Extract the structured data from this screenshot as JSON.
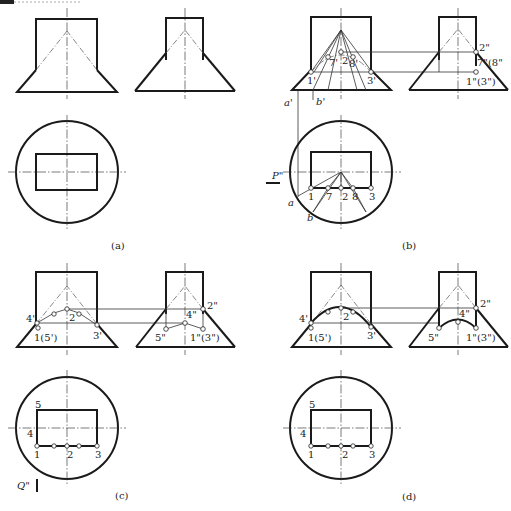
{
  "figure": {
    "panels": [
      {
        "id": "a",
        "caption": "(a)"
      },
      {
        "id": "b",
        "caption": "(b)"
      },
      {
        "id": "c",
        "caption": "(c)"
      },
      {
        "id": "d",
        "caption": "(d)"
      }
    ]
  },
  "labels": {
    "b": {
      "front": [
        "1'",
        "7'",
        "2'",
        "8'",
        "3'",
        "a'",
        "b'"
      ],
      "side": [
        "2\"",
        "7\"(8\"",
        "1\"(3\")"
      ],
      "top": [
        "1",
        "7",
        "2",
        "8",
        "3",
        "a",
        "b"
      ],
      "plane": "P\""
    },
    "c": {
      "front": [
        "4'",
        "1'(5')",
        "2'",
        "3'"
      ],
      "side": [
        "2\"",
        "4\"",
        "5\"",
        "1\"(3\")"
      ],
      "top": [
        "5",
        "4",
        "1",
        "2",
        "3"
      ],
      "plane": "Q\""
    },
    "d": {
      "front": [
        "4'",
        "1'(5')",
        "2'",
        "3'"
      ],
      "side": [
        "2\"",
        "4\"",
        "5\"",
        "1\"(3\")"
      ],
      "top": [
        "5",
        "4",
        "1",
        "2",
        "3"
      ]
    }
  },
  "text": {
    "b_1p": "1'",
    "b_7p": "7'",
    "b_2p": "2",
    "b_8p": "8'",
    "b_3p": "3'",
    "b_ap": "a'",
    "b_bp": "b'",
    "b_2pp": "2\"",
    "b_78pp": "7\"(8\"",
    "b_13pp": "1\"(3\")",
    "b_1": "1",
    "b_7": "7",
    "b_2": "2",
    "b_8": "8",
    "b_3": "3",
    "b_a": "a",
    "b_b": "b",
    "b_P": "P\"",
    "c_4p": "4'",
    "c_15p": "1(5')",
    "c_2p": "2",
    "c_3p": "3'",
    "c_2pp": "2\"",
    "c_4pp": "4\"",
    "c_5pp": "5\"",
    "c_13pp": "1\"(3\")",
    "c_5": "5",
    "c_4": "4",
    "c_1": "1",
    "c_2": "2",
    "c_3": "3",
    "c_Q": "Q\"",
    "d_4p": "4'",
    "d_15p": "1(5')",
    "d_2p": "2",
    "d_3p": "3'",
    "d_2pp": "2\"",
    "d_4pp": "4\"",
    "d_5pp": "5\"",
    "d_13pp": "1\"(3\")",
    "d_5": "5",
    "d_4": "4",
    "d_1": "1",
    "d_2": "2",
    "d_3": "3"
  }
}
